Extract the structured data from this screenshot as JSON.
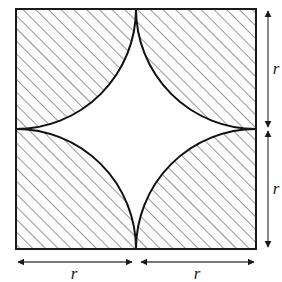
{
  "figure": {
    "name": "square-with-four-quarter-circles",
    "square": {
      "x": 16,
      "y": 9,
      "side": 240,
      "half_side": 120,
      "stroke": "#1a1a1a",
      "stroke_width": 2,
      "fill": "#ffffff"
    },
    "center": {
      "x": 136,
      "y": 129
    },
    "quarter_circles": [
      {
        "name": "top-left-quarter-circle",
        "center_x": 16,
        "center_y": 9,
        "radius": 120,
        "hatched": true
      },
      {
        "name": "top-right-quarter-circle",
        "center_x": 256,
        "center_y": 9,
        "radius": 120,
        "hatched": true
      },
      {
        "name": "bottom-left-quarter-circle",
        "center_x": 16,
        "center_y": 249,
        "radius": 120,
        "hatched": true
      },
      {
        "name": "bottom-right-quarter-circle",
        "center_x": 256,
        "center_y": 249,
        "radius": 120,
        "hatched": true
      }
    ],
    "cusp_points": [
      {
        "name": "top-cusp",
        "x": 136,
        "y": 9
      },
      {
        "name": "right-cusp",
        "x": 256,
        "y": 129
      },
      {
        "name": "bottom-cusp",
        "x": 136,
        "y": 249
      },
      {
        "name": "left-cusp",
        "x": 16,
        "y": 129
      }
    ],
    "divider_segments": [
      {
        "name": "left-midline-segment",
        "x1": 16,
        "y1": 129,
        "x2": 26,
        "y2": 129
      },
      {
        "name": "right-midline-segment",
        "x1": 246,
        "y1": 129,
        "x2": 256,
        "y2": 129
      },
      {
        "name": "bottom-midline-segment",
        "x1": 136,
        "y1": 239,
        "x2": 136,
        "y2": 249
      },
      {
        "name": "top-midline-segment",
        "x1": 136,
        "y1": 9,
        "x2": 136,
        "y2": 19
      }
    ],
    "hatch": {
      "angle_degrees": 45,
      "spacing": 9,
      "stroke": "#4a4a4a",
      "stroke_width": 1.1,
      "background": "#fdfdfd"
    },
    "arc_stroke": "#111111",
    "arc_stroke_width": 2
  },
  "dimensions": {
    "label": "r",
    "line_color": "#4a4a4a",
    "arrow_color": "#1a1a1a",
    "vertical": [
      {
        "name": "right-upper-dimension",
        "label": "r",
        "x": 268,
        "y_start": 9,
        "y_end": 129,
        "label_x": 276,
        "label_y": 74
      },
      {
        "name": "right-lower-dimension",
        "label": "r",
        "x": 268,
        "y_start": 129,
        "y_end": 249,
        "label_x": 276,
        "label_y": 194
      }
    ],
    "horizontal": [
      {
        "name": "bottom-left-dimension",
        "label": "r",
        "y": 262,
        "x_start": 16,
        "x_end": 134,
        "label_x": 74,
        "label_y": 278
      },
      {
        "name": "bottom-right-dimension",
        "label": "r",
        "y": 262,
        "x_start": 139,
        "x_end": 256,
        "label_x": 197,
        "label_y": 278
      }
    ]
  }
}
